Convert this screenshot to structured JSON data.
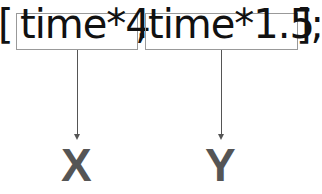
{
  "code": {
    "open_bracket": "[",
    "arg1": "time*4",
    "comma": ",",
    "arg2": "time*1.5",
    "close": "];"
  },
  "labels": {
    "x": "X",
    "y": "Y"
  },
  "colors": {
    "text": "#111111",
    "box_border": "#999999",
    "arrow": "#555555",
    "label": "#555555"
  }
}
